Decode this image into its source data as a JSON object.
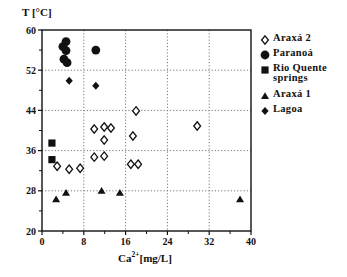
{
  "chart_data": {
    "type": "scatter",
    "title": "",
    "xlabel": "Ca2+ [mg/L]",
    "ylabel": "T [°C]",
    "xlim": [
      0,
      40
    ],
    "ylim": [
      20,
      60
    ],
    "x_ticks": [
      0,
      8,
      16,
      24,
      32,
      40
    ],
    "y_ticks": [
      20,
      28,
      36,
      44,
      52,
      60
    ],
    "grid": "dotted",
    "legend_position": "right",
    "series": [
      {
        "name": "Araxá 2",
        "marker": "open-diamond",
        "points": [
          [
            2.9,
            32.9
          ],
          [
            5.2,
            32.3
          ],
          [
            7.3,
            32.5
          ],
          [
            10.0,
            40.3
          ],
          [
            10.0,
            34.7
          ],
          [
            11.9,
            40.7
          ],
          [
            13.2,
            40.5
          ],
          [
            11.9,
            38.1
          ],
          [
            11.9,
            34.9
          ],
          [
            17.4,
            38.9
          ],
          [
            18.0,
            43.9
          ],
          [
            17.0,
            33.3
          ],
          [
            18.4,
            33.3
          ],
          [
            29.7,
            40.9
          ]
        ]
      },
      {
        "name": "Paranoá",
        "marker": "filled-circle",
        "points": [
          [
            4.6,
            57.7
          ],
          [
            4.0,
            56.7
          ],
          [
            4.6,
            55.9
          ],
          [
            4.2,
            54.2
          ],
          [
            4.8,
            53.5
          ],
          [
            10.3,
            56.0
          ]
        ]
      },
      {
        "name": "Rio Quente springs",
        "marker": "filled-square",
        "points": [
          [
            1.9,
            37.5
          ],
          [
            1.9,
            34.2
          ]
        ]
      },
      {
        "name": "Araxá 1",
        "marker": "filled-triangle",
        "points": [
          [
            2.7,
            26.3
          ],
          [
            4.6,
            27.6
          ],
          [
            11.4,
            28.0
          ],
          [
            14.9,
            27.6
          ],
          [
            37.9,
            26.3
          ]
        ]
      },
      {
        "name": "Lagoa",
        "marker": "filled-diamond",
        "points": [
          [
            5.2,
            49.9
          ],
          [
            10.3,
            48.9
          ]
        ]
      }
    ]
  },
  "axes": {
    "y_title": "T [°C]",
    "x_title_base": "Ca",
    "x_title_sup": "2+",
    "x_title_unit": "[mg/L]"
  },
  "legend": {
    "items": [
      {
        "label": "Araxá 2",
        "marker": "open-diamond"
      },
      {
        "label": "Paranoá",
        "marker": "filled-circle"
      },
      {
        "label": "Rio Quente\nsprings",
        "marker": "filled-square"
      },
      {
        "label": "Araxá 1",
        "marker": "filled-triangle"
      },
      {
        "label": "Lagoa",
        "marker": "filled-diamond"
      }
    ]
  },
  "colors": {
    "ink": "#111111",
    "grid": "#777777",
    "background": "#ffffff"
  }
}
